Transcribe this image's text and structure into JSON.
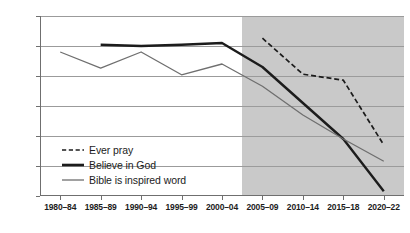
{
  "chart_data": {
    "type": "line",
    "title": "",
    "subtitle": "",
    "xlabel": "",
    "ylabel": "",
    "categories": [
      "1980–84",
      "1985–89",
      "1990–94",
      "1995–99",
      "2000–04",
      "2005–09",
      "2010–14",
      "2015–18",
      "2020–22"
    ],
    "yticks": [
      60,
      65,
      70,
      75,
      80,
      85,
      90
    ],
    "ylim": [
      60,
      90
    ],
    "grid": true,
    "legend_position": "inside-lower-left",
    "shaded_region": {
      "from_category": "2005–09",
      "note": "gray background band covering 2005–09 through 2020–22",
      "color": "#c9c9c9"
    },
    "series": [
      {
        "name": "Ever pray",
        "style": "dashed",
        "color": "#1c1c1c",
        "values": [
          null,
          null,
          null,
          null,
          null,
          86.3,
          80.3,
          79.3,
          68.5
        ]
      },
      {
        "name": "Believe in God",
        "style": "solid-thick",
        "color": "#1c1c1c",
        "values": [
          null,
          85.2,
          85.0,
          85.2,
          85.5,
          81.5,
          75.5,
          69.5,
          60.8
        ]
      },
      {
        "name": "Bible is inspired word",
        "style": "solid-thin",
        "color": "#6f6f6f",
        "values": [
          84.0,
          81.3,
          84.0,
          80.2,
          82.0,
          78.3,
          73.5,
          69.5,
          65.8
        ]
      }
    ]
  },
  "legend": {
    "items": [
      {
        "label": "Ever pray",
        "icon": "dashed-line-icon"
      },
      {
        "label": "Believe in God",
        "icon": "thick-line-icon"
      },
      {
        "label": "Bible is inspired word",
        "icon": "thin-line-icon"
      }
    ]
  }
}
